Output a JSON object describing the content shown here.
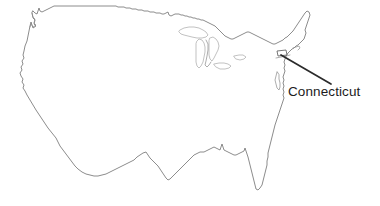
{
  "figure": {
    "type": "outline-map",
    "region": "Contiguous United States",
    "background_color": "#ffffff",
    "outline_color": "#6e6e6e",
    "lake_outline_color": "#a8a8a8",
    "leader_line_color": "#2b2b2b",
    "label_color": "#1c1c1c",
    "width": 380,
    "height": 206
  },
  "callout": {
    "label": "Connecticut",
    "leader_from": {
      "x": 282,
      "y": 56
    },
    "leader_to": {
      "x": 330,
      "y": 84
    },
    "label_position": {
      "x": 288,
      "y": 84
    }
  },
  "annotations": [
    {
      "name": "connecticut",
      "label": "Connecticut"
    }
  ],
  "icons": {
    "pointer": "leader-line-icon",
    "marker": "state-highlight-icon"
  }
}
